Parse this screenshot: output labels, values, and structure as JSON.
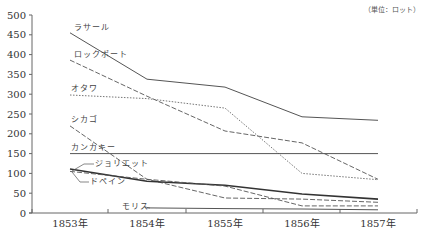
{
  "chart_data": {
    "type": "line",
    "title": "",
    "unit_label": "（単位：ロット）",
    "xlabel": "",
    "ylabel": "",
    "categories": [
      "1853年",
      "1854年",
      "1855年",
      "1856年",
      "1857年"
    ],
    "ylim": [
      0,
      500
    ],
    "yticks": [
      0,
      50,
      100,
      150,
      200,
      250,
      300,
      350,
      400,
      450,
      500
    ],
    "grid": false,
    "legend": "inline labels",
    "series": [
      {
        "name": "ラサール",
        "style": "solid",
        "values": [
          455,
          338,
          318,
          243,
          234
        ]
      },
      {
        "name": "ロックポート",
        "style": "dashed",
        "values": [
          386,
          295,
          207,
          177,
          85
        ]
      },
      {
        "name": "オタワ",
        "style": "dotted",
        "values": [
          298,
          289,
          265,
          100,
          84
        ]
      },
      {
        "name": "シカゴ",
        "style": "dashed",
        "values": [
          220,
          85,
          38,
          35,
          27
        ]
      },
      {
        "name": "カンカキー",
        "style": "solid",
        "values": [
          150,
          150,
          150,
          150,
          150
        ]
      },
      {
        "name": "ジョリエット",
        "style": "solid-thick",
        "values": [
          111,
          80,
          70,
          48,
          35
        ]
      },
      {
        "name": "ドペイン",
        "style": "dashed",
        "values": [
          105,
          85,
          68,
          18,
          18
        ]
      },
      {
        "name": "モリス",
        "style": "solid",
        "values": [
          null,
          13,
          11,
          10,
          8
        ]
      }
    ]
  }
}
